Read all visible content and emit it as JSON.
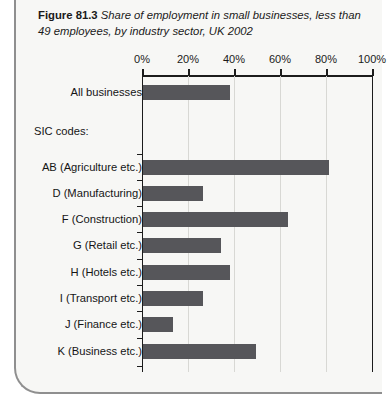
{
  "figure": {
    "number": "Figure 81.3",
    "title": "Share of employment in small businesses, less than 49 employees, by industry sector, UK 2002",
    "section_label": "SIC codes:"
  },
  "chart_data": {
    "type": "bar",
    "orientation": "horizontal",
    "title": "Share of employment in small businesses, less than 49 employees, by industry sector, UK 2002",
    "xlabel": "",
    "ylabel": "",
    "xlim": [
      0,
      100
    ],
    "grid": true,
    "legend": "none",
    "tick_labels": [
      "0%",
      "20%",
      "40%",
      "60%",
      "80%",
      "100%"
    ],
    "tick_values": [
      0,
      20,
      40,
      60,
      80,
      100
    ],
    "categories": [
      "All businesses",
      "AB (Agriculture etc.)",
      "D (Manufacturing)",
      "F (Construction)",
      "G (Retail etc.)",
      "H (Hotels etc.)",
      "I (Transport etc.)",
      "J (Finance etc.)",
      "K (Business etc.)"
    ],
    "values": [
      38,
      81,
      26,
      63,
      34,
      38,
      26,
      13,
      49
    ],
    "bar_color": "#56565a"
  },
  "axis": {
    "ticks": [
      {
        "label": "0%",
        "value": 0
      },
      {
        "label": "20%",
        "value": 20
      },
      {
        "label": "40%",
        "value": 40
      },
      {
        "label": "60%",
        "value": 60
      },
      {
        "label": "80%",
        "value": 80
      },
      {
        "label": "100%",
        "value": 100
      }
    ]
  },
  "rows": [
    {
      "label": "All businesses",
      "value": 38
    },
    {
      "label": "AB (Agriculture etc.)",
      "value": 81
    },
    {
      "label": "D (Manufacturing)",
      "value": 26
    },
    {
      "label": "F (Construction)",
      "value": 63
    },
    {
      "label": "G (Retail etc.)",
      "value": 34
    },
    {
      "label": "H (Hotels etc.)",
      "value": 38
    },
    {
      "label": "I (Transport etc.)",
      "value": 26
    },
    {
      "label": "J (Finance etc.)",
      "value": 13
    },
    {
      "label": "K (Business etc.)",
      "value": 49
    }
  ],
  "colors": {
    "bar": "#56565a",
    "axis": "#1c1c1c",
    "grid": "#d8d8d4",
    "frame": "#8f8f8f",
    "background": "#f7f7f5"
  }
}
